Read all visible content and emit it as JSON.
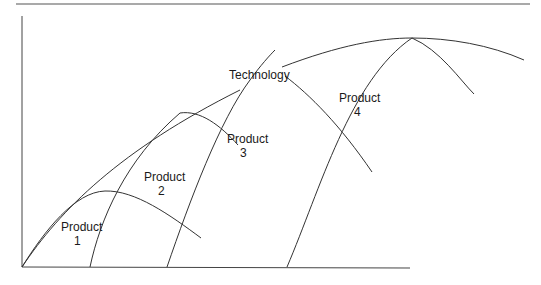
{
  "diagram": {
    "type": "technology-and-product-life-cycles",
    "axes": {
      "x_label": "",
      "y_label": ""
    },
    "curves": [
      {
        "id": "technology",
        "label": "Technology"
      },
      {
        "id": "product-1",
        "label_line1": "Product",
        "label_line2": "1"
      },
      {
        "id": "product-2",
        "label_line1": "Product",
        "label_line2": "2"
      },
      {
        "id": "product-3",
        "label_line1": "Product",
        "label_line2": "3"
      },
      {
        "id": "product-4",
        "label_line1": "Product",
        "label_line2": "4"
      }
    ],
    "colors": {
      "line": "#333333",
      "background": "#ffffff",
      "top_rule": "#555555"
    }
  }
}
